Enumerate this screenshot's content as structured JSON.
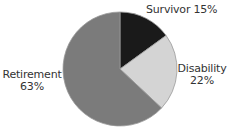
{
  "chart_data": {
    "type": "pie",
    "title": "",
    "start_angle_deg": 90,
    "direction": "clockwise",
    "slices": [
      {
        "label": "Survivor",
        "value": 15,
        "display": "15%",
        "color": "#1a1a1a"
      },
      {
        "label": "Disability",
        "value": 22,
        "display": "22%",
        "color": "#d4d4d4"
      },
      {
        "label": "Retirement",
        "value": 63,
        "display": "63%",
        "color": "#7b7b7b"
      }
    ],
    "categories": [
      "Survivor",
      "Disability",
      "Retirement"
    ],
    "values": [
      15,
      22,
      63
    ],
    "legend": "none (inline labels)",
    "outline_color": "#9a9a9a"
  },
  "labels": {
    "survivor": {
      "name": "Survivor",
      "pct": "15%"
    },
    "disability": {
      "name": "Disability",
      "pct": "22%"
    },
    "retirement": {
      "name": "Retirement",
      "pct": "63%"
    }
  }
}
